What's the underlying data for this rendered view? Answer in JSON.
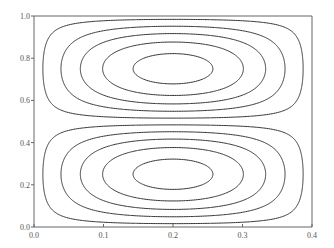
{
  "chart_data": {
    "type": "contour",
    "title": "",
    "xlabel": "",
    "ylabel": "",
    "xlim": [
      0.0,
      0.4
    ],
    "ylim": [
      0.0,
      1.0
    ],
    "grid": false,
    "legend": null,
    "x_ticks": [
      "0.0",
      "0.1",
      "0.2",
      "0.3",
      "0.4"
    ],
    "y_ticks": [
      "0.0",
      "0.2",
      "0.4",
      "0.6",
      "0.8",
      "1.0"
    ],
    "field": "psi(x,y) = sin(pi*x/0.4) * sin(2*pi*y)",
    "levels": [
      0.1,
      0.3,
      0.5,
      0.7,
      0.9
    ],
    "cells": [
      {
        "name": "upper cell",
        "center": [
          0.2,
          0.8
        ],
        "sign": "negative",
        "num_contours": 5
      },
      {
        "name": "lower cell",
        "center": [
          0.2,
          0.2
        ],
        "sign": "positive",
        "num_contours": 5
      }
    ],
    "line_color": "#333333"
  },
  "axes": {
    "color": "#555555",
    "x_tick_labels": [
      "0.0",
      "0.1",
      "0.2",
      "0.3",
      "0.4"
    ],
    "y_tick_labels": [
      "0.0",
      "0.2",
      "0.4",
      "0.6",
      "0.8",
      "1.0"
    ]
  }
}
